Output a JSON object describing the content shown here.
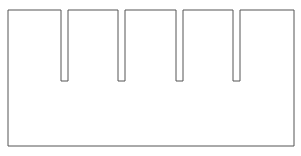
{
  "canvas": {
    "width": 301,
    "height": 156,
    "background_color": "#ffffff"
  },
  "figure": {
    "name": "comb-shape",
    "stroke_color": "#555555",
    "fill_color": "#ffffff",
    "stroke_width": 1,
    "body": {
      "left": 8,
      "top": 10,
      "right": 294,
      "bottom": 146,
      "width": 286,
      "height": 136
    },
    "slots": [
      {
        "id": "slot-1",
        "left": 61,
        "right": 68,
        "width": 7,
        "top": 10,
        "bottom": 81,
        "depth": 71
      },
      {
        "id": "slot-2",
        "left": 118,
        "right": 125,
        "width": 7,
        "top": 10,
        "bottom": 81,
        "depth": 71
      },
      {
        "id": "slot-3",
        "left": 176,
        "right": 183,
        "width": 7,
        "top": 10,
        "bottom": 81,
        "depth": 71
      },
      {
        "id": "slot-4",
        "left": 233,
        "right": 240,
        "width": 7,
        "top": 10,
        "bottom": 81,
        "depth": 71
      }
    ],
    "teeth": [
      {
        "id": "tooth-1",
        "left": 8,
        "right": 61,
        "width": 53
      },
      {
        "id": "tooth-2",
        "left": 68,
        "right": 118,
        "width": 50
      },
      {
        "id": "tooth-3",
        "left": 125,
        "right": 176,
        "width": 51
      },
      {
        "id": "tooth-4",
        "left": 183,
        "right": 233,
        "width": 50
      },
      {
        "id": "tooth-5",
        "left": 240,
        "right": 294,
        "width": 54
      }
    ],
    "path": "M 8 10 L 61 10 L 61 81 L 68 81 L 68 10 L 118 10 L 118 81 L 125 81 L 125 10 L 176 10 L 176 81 L 183 81 L 183 10 L 233 10 L 233 81 L 240 81 L 240 10 L 294 10 L 294 146 L 8 146 Z"
  }
}
